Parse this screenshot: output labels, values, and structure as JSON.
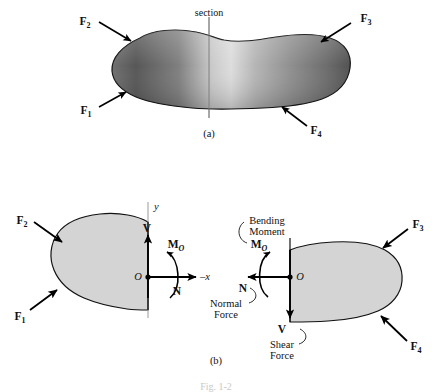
{
  "figure": {
    "section_label": "section",
    "caption_a": "(a)",
    "caption_b": "(b)",
    "figure_caption": "Fig. 1-2",
    "colors": {
      "body_fill_fbd": "#d4d4d4",
      "body_outline": "#1a1a1a",
      "body_gradient_dark": "#4a4a4a",
      "body_gradient_light": "#d8d8d8",
      "axis_line": "#9a9a9a",
      "arrow": "#000000",
      "caption_faint": "#c9c9c9"
    }
  },
  "part_a": {
    "forces": [
      {
        "name": "F1",
        "base": "F",
        "sub": "1"
      },
      {
        "name": "F2",
        "base": "F",
        "sub": "2"
      },
      {
        "name": "F3",
        "base": "F",
        "sub": "3"
      },
      {
        "name": "F4",
        "base": "F",
        "sub": "4"
      }
    ]
  },
  "part_b": {
    "left_fbd": {
      "forces": [
        {
          "name": "F2",
          "base": "F",
          "sub": "2"
        },
        {
          "name": "F1",
          "base": "F",
          "sub": "1"
        }
      ],
      "axes": {
        "y": "y",
        "x": "–x"
      },
      "origin": "O",
      "internal": [
        {
          "name": "V",
          "base": "V",
          "sub": ""
        },
        {
          "name": "MO",
          "base": "M",
          "sub": "O"
        },
        {
          "name": "N",
          "base": "N",
          "sub": ""
        }
      ]
    },
    "right_fbd": {
      "forces": [
        {
          "name": "F3",
          "base": "F",
          "sub": "3"
        },
        {
          "name": "F4",
          "base": "F",
          "sub": "4"
        }
      ],
      "origin": "O",
      "internal": [
        {
          "name": "MO",
          "base": "M",
          "sub": "O"
        },
        {
          "name": "N",
          "base": "N",
          "sub": ""
        },
        {
          "name": "V",
          "base": "V",
          "sub": ""
        }
      ],
      "annotations": {
        "bending_moment_line1": "Bending",
        "bending_moment_line2": "Moment",
        "normal_force_line1": "Normal",
        "normal_force_line2": "Force",
        "shear_force_line1": "Shear",
        "shear_force_line2": "Force"
      }
    }
  }
}
